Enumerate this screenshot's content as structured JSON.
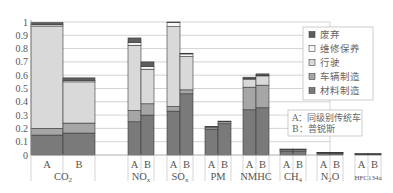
{
  "chart_data": {
    "type": "bar",
    "stacked": true,
    "title": "",
    "xlabel": "",
    "ylabel": "",
    "ylim": [
      0,
      1
    ],
    "yticks": [
      "0",
      "0.1",
      "0.2",
      "0.3",
      "0.4",
      "0.5",
      "0.6",
      "0.7",
      "0.8",
      "0.9",
      "1"
    ],
    "grid": true,
    "groups": [
      {
        "label": "CO2",
        "label_main": "CO",
        "label_sub": "2",
        "bars": [
          "A",
          "B"
        ]
      },
      {
        "label": "NOx",
        "label_main": "NO",
        "label_sub": "x",
        "bars": [
          "A",
          "B"
        ]
      },
      {
        "label": "SOx",
        "label_main": "SO",
        "label_sub": "x",
        "bars": [
          "A",
          "B"
        ]
      },
      {
        "label": "PM",
        "label_main": "PM",
        "label_sub": "",
        "bars": [
          "A",
          "B"
        ]
      },
      {
        "label": "NMHC",
        "label_main": "NMHC",
        "label_sub": "",
        "bars": [
          "A",
          "B"
        ]
      },
      {
        "label": "CH4",
        "label_main": "CH",
        "label_sub": "4",
        "bars": [
          "A",
          "B"
        ]
      },
      {
        "label": "N2O",
        "label_main": "N",
        "label_sub": "2",
        "label_tail": "O",
        "bars": [
          "A",
          "B"
        ]
      },
      {
        "label": "HFC134a",
        "label_main": "HFC134a",
        "label_sub": "",
        "bars": [
          "A",
          "B"
        ]
      }
    ],
    "categories": [
      "CO2-A",
      "CO2-B",
      "NOx-A",
      "NOx-B",
      "SOx-A",
      "SOx-B",
      "PM-A",
      "PM-B",
      "NMHC-A",
      "NMHC-B",
      "CH4-A",
      "CH4-B",
      "N2O-A",
      "N2O-B",
      "HFC134a-A",
      "HFC134a-B"
    ],
    "series": [
      {
        "name": "材料制造",
        "color": "#7a7a7a",
        "values": [
          0.15,
          0.165,
          0.25,
          0.3,
          0.33,
          0.46,
          0.195,
          0.235,
          0.34,
          0.355,
          0.03,
          0.03,
          0.015,
          0.015,
          0.005,
          0.005
        ]
      },
      {
        "name": "车辆制造",
        "color": "#a6a6a6",
        "values": [
          0.05,
          0.075,
          0.085,
          0.085,
          0.035,
          0.03,
          0.015,
          0.015,
          0.17,
          0.17,
          0.01,
          0.01,
          0.003,
          0.003,
          0.003,
          0.003
        ]
      },
      {
        "name": "行驶",
        "color": "#d9d9d9",
        "values": [
          0.77,
          0.31,
          0.49,
          0.26,
          0.6,
          0.25,
          0.0,
          0.0,
          0.06,
          0.07,
          0.003,
          0.003,
          0.0,
          0.0,
          0.0,
          0.0
        ]
      },
      {
        "name": "维修保养",
        "color": "#f7f7f7",
        "values": [
          0.01,
          0.01,
          0.02,
          0.02,
          0.03,
          0.02,
          0.0,
          0.0,
          0.005,
          0.005,
          0.0,
          0.0,
          0.0,
          0.0,
          0.0,
          0.0
        ]
      },
      {
        "name": "废弃",
        "color": "#5e5e5e",
        "values": [
          0.015,
          0.02,
          0.035,
          0.035,
          0.005,
          0.005,
          0.005,
          0.005,
          0.01,
          0.01,
          0.002,
          0.002,
          0.002,
          0.002,
          0.002,
          0.002
        ]
      }
    ],
    "legend": {
      "position": "upper right",
      "entries": [
        "废弃",
        "维修保养",
        "行驶",
        "车辆制造",
        "材料制造"
      ]
    },
    "annotation": {
      "lines": [
        "A：同级别传统车",
        "B：普锐斯"
      ]
    }
  }
}
